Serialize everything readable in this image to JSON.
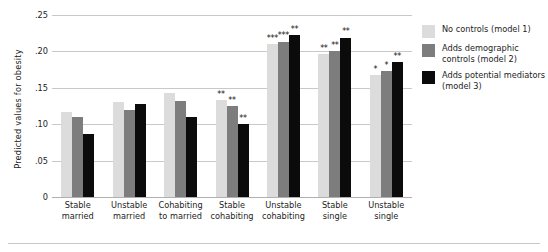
{
  "axis": {
    "ylabel": "Predicted values for obesity",
    "yticks": [
      ".25",
      ".20",
      ".15",
      ".10",
      ".05",
      "0"
    ]
  },
  "legend": {
    "items": [
      {
        "label": "No controls (model 1)",
        "color": "#dcdcdc",
        "swatch": "legend-swatch-model1"
      },
      {
        "label": "Adds demographic controls (model 2)",
        "color": "#7d7d7d",
        "swatch": "legend-swatch-model2"
      },
      {
        "label": "Adds potential mediators (model 3)",
        "color": "#0b0b0b",
        "swatch": "legend-swatch-model3"
      }
    ]
  },
  "categories_display": [
    {
      "line1": "Stable",
      "line2": "married"
    },
    {
      "line1": "Unstable",
      "line2": "married"
    },
    {
      "line1": "Cohabiting",
      "line2": "to married"
    },
    {
      "line1": "Stable",
      "line2": "cohabiting"
    },
    {
      "line1": "Unstable",
      "line2": "cohabiting"
    },
    {
      "line1": "Stable",
      "line2": "single"
    },
    {
      "line1": "Unstable",
      "line2": "single"
    }
  ],
  "chart_data": {
    "type": "bar",
    "title": "",
    "xlabel": "",
    "ylabel": "Predicted values for obesity",
    "ylim": [
      0,
      0.25
    ],
    "ytick_values": [
      0.25,
      0.2,
      0.15,
      0.1,
      0.05,
      0
    ],
    "grid": true,
    "legend_position": "right",
    "categories": [
      "Stable married",
      "Unstable married",
      "Cohabiting to married",
      "Stable cohabiting",
      "Unstable cohabiting",
      "Stable single",
      "Unstable single"
    ],
    "series": [
      {
        "name": "No controls (model 1)",
        "color": "#dcdcdc",
        "values": [
          0.117,
          0.13,
          0.143,
          0.133,
          0.21,
          0.196,
          0.167
        ],
        "significance": [
          "",
          "",
          "",
          "**",
          "***",
          "**",
          "*"
        ]
      },
      {
        "name": "Adds demographic controls (model 2)",
        "color": "#7d7d7d",
        "values": [
          0.11,
          0.119,
          0.132,
          0.125,
          0.213,
          0.2,
          0.173
        ],
        "significance": [
          "",
          "",
          "",
          "**",
          "***",
          "**",
          "*"
        ]
      },
      {
        "name": "Adds potential mediators (model 3)",
        "color": "#0b0b0b",
        "values": [
          0.087,
          0.128,
          0.11,
          0.1,
          0.222,
          0.219,
          0.185
        ],
        "significance": [
          "",
          "",
          "",
          "**",
          "**",
          "**",
          "**"
        ]
      }
    ]
  }
}
